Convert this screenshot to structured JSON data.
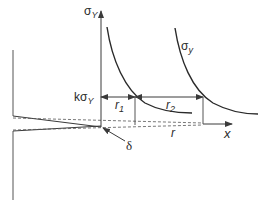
{
  "diagram": {
    "type": "crack-tip plastic zone / strip yield schematic",
    "colors": {
      "line": "#3a3a3a",
      "curve": "#2a2a2a",
      "dashed": "#555555",
      "background": "#ffffff"
    },
    "labels": {
      "y_axis": {
        "symbol": "σ",
        "subscript": "Y"
      },
      "curve_label": {
        "symbol": "σ",
        "subscript": "y"
      },
      "level": {
        "prefix": "k",
        "symbol": "σ",
        "subscript": "Y"
      },
      "r1": {
        "symbol": "r",
        "subscript": "1"
      },
      "r2": {
        "symbol": "r",
        "subscript": "2"
      },
      "r": "r",
      "x_axis": "x",
      "delta": "δ"
    },
    "elements": [
      "specimen edge (left vertical line)",
      "crack faces converging to tip",
      "dashed extension lines along x-axis",
      "σY vertical axis with arrow",
      "two stress-distribution curves",
      "kσY horizontal level with double arrows r1 and r2",
      "x-axis arrow",
      "δ crack-tip opening pointer"
    ]
  }
}
